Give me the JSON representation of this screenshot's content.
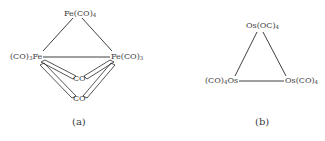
{
  "figure_a": {
    "caption": "(a)",
    "top": {
      "pre": "Fe(CO)",
      "sub": "4",
      "post": ""
    },
    "left": {
      "pre": "(CO)",
      "sub": "3",
      "post": "Fe"
    },
    "right": {
      "pre": "Fe(CO)",
      "sub": "3",
      "post": ""
    },
    "bridge_upper": "CO",
    "bridge_lower": "CO"
  },
  "figure_b": {
    "caption": "(b)",
    "top": {
      "pre": "Os(OC)",
      "sub": "4",
      "post": ""
    },
    "left": {
      "pre": "(CO)",
      "sub": "4",
      "post": "Os"
    },
    "right": {
      "pre": "Os(CO)",
      "sub": "4",
      "post": ""
    }
  },
  "colors": {
    "line": "#2a2a2a",
    "text": "#3a3a3a",
    "background": "#ffffff"
  }
}
